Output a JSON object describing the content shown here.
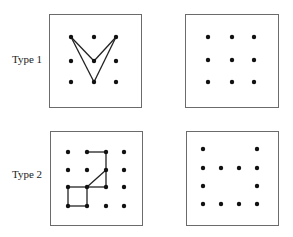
{
  "colors": {
    "background": "#ffffff",
    "box_border": "#6b6b6b",
    "dot": "#111111",
    "line": "#222222",
    "label": "#222222"
  },
  "rows": [
    {
      "label": "Type 1",
      "panels": [
        {
          "name": "type1-with-lines",
          "grid": "3x3",
          "dots": [
            [
              0,
              0
            ],
            [
              1,
              0
            ],
            [
              2,
              0
            ],
            [
              0,
              1
            ],
            [
              1,
              1
            ],
            [
              2,
              1
            ],
            [
              0,
              2
            ],
            [
              1,
              2
            ],
            [
              2,
              2
            ]
          ],
          "lines": [
            [
              [
                0,
                0
              ],
              [
                1,
                1
              ]
            ],
            [
              [
                1,
                1
              ],
              [
                2,
                0
              ]
            ],
            [
              [
                0,
                0
              ],
              [
                1,
                2
              ]
            ],
            [
              [
                1,
                2
              ],
              [
                2,
                0
              ]
            ]
          ]
        },
        {
          "name": "type1-dots-only",
          "grid": "3x3",
          "dots": [
            [
              0,
              0
            ],
            [
              1,
              0
            ],
            [
              2,
              0
            ],
            [
              0,
              1
            ],
            [
              1,
              1
            ],
            [
              2,
              1
            ],
            [
              0,
              2
            ],
            [
              1,
              2
            ],
            [
              2,
              2
            ]
          ],
          "lines": []
        }
      ]
    },
    {
      "label": "Type 2",
      "panels": [
        {
          "name": "type2-with-lines",
          "grid": "4x4",
          "dots": [
            [
              0,
              0
            ],
            [
              1,
              0
            ],
            [
              2,
              0
            ],
            [
              3,
              0
            ],
            [
              0,
              1
            ],
            [
              1,
              1
            ],
            [
              2,
              1
            ],
            [
              3,
              1
            ],
            [
              0,
              2
            ],
            [
              1,
              2
            ],
            [
              2,
              2
            ],
            [
              3,
              2
            ],
            [
              0,
              3
            ],
            [
              1,
              3
            ],
            [
              2,
              3
            ],
            [
              3,
              3
            ]
          ],
          "lines": [
            [
              [
                1,
                0
              ],
              [
                2,
                0
              ]
            ],
            [
              [
                2,
                0
              ],
              [
                2,
                1
              ]
            ],
            [
              [
                2,
                1
              ],
              [
                2,
                2
              ]
            ],
            [
              [
                2,
                1
              ],
              [
                1,
                2
              ]
            ],
            [
              [
                1,
                2
              ],
              [
                2,
                2
              ]
            ],
            [
              [
                0,
                2
              ],
              [
                1,
                2
              ]
            ],
            [
              [
                0,
                2
              ],
              [
                0,
                3
              ]
            ],
            [
              [
                0,
                3
              ],
              [
                1,
                3
              ]
            ],
            [
              [
                1,
                2
              ],
              [
                1,
                3
              ]
            ]
          ]
        },
        {
          "name": "type2-dots-only",
          "grid": "4x4",
          "dots": [
            [
              0,
              0
            ],
            [
              3,
              0
            ],
            [
              0,
              1
            ],
            [
              1,
              1
            ],
            [
              2,
              1
            ],
            [
              3,
              1
            ],
            [
              0,
              2
            ],
            [
              3,
              2
            ],
            [
              0,
              3
            ],
            [
              1,
              3
            ],
            [
              2,
              3
            ],
            [
              3,
              3
            ]
          ],
          "lines": []
        }
      ]
    }
  ]
}
